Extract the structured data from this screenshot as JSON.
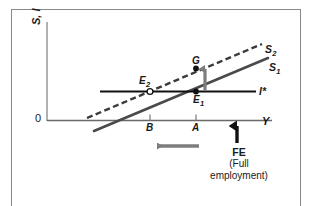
{
  "figure": {
    "domain": "diagram",
    "background_color": "#ffffff",
    "frame_color": "#8a8a8a"
  },
  "axes": {
    "y_label": "S, I",
    "x_label": "Y",
    "origin_label": "0",
    "x_axis_color": "#555555",
    "y_axis_color": "#888888"
  },
  "curves": [
    {
      "id": "S2",
      "label": "S",
      "subscript": "2",
      "style": "dashed",
      "color": "#3a3a3a",
      "description": "shifted saving schedule"
    },
    {
      "id": "S1",
      "label": "S",
      "subscript": "1",
      "style": "solid",
      "color": "#4a4a4a",
      "description": "original saving schedule"
    },
    {
      "id": "Istar",
      "label": "I*",
      "subscript": "",
      "style": "solid-horizontal",
      "color": "#111111",
      "description": "autonomous investment level"
    }
  ],
  "points": [
    {
      "id": "E1",
      "label": "E",
      "subscript": "1",
      "marker": "filled-dot",
      "description": "initial equilibrium on S1 and I*"
    },
    {
      "id": "E2",
      "label": "E",
      "subscript": "2",
      "marker": "open-dot",
      "description": "new equilibrium on S2 and I*"
    },
    {
      "id": "G",
      "label": "G",
      "subscript": "",
      "marker": "filled-dot",
      "description": "point on S2 above E1"
    }
  ],
  "ticks": [
    {
      "id": "B",
      "label": "B",
      "description": "output level at new equilibrium"
    },
    {
      "id": "A",
      "label": "A",
      "description": "output level at initial equilibrium"
    }
  ],
  "annotations": {
    "full_employment": {
      "marker": "up-arrow",
      "main_label": "FE",
      "sub_label": "(Full\nemployment)",
      "sub_label_line1": "(Full",
      "sub_label_line2": "employment)",
      "color": "#111111"
    },
    "shift_arrow": {
      "id": "output-contraction-arrow",
      "direction": "left",
      "color": "#7d7d7d",
      "description": "output falls from A to B"
    },
    "saving_rise_arrow": {
      "id": "saving-increase-arrow",
      "direction": "up",
      "color": "#7d7d7d",
      "description": "saving rises from E1 to G"
    }
  }
}
